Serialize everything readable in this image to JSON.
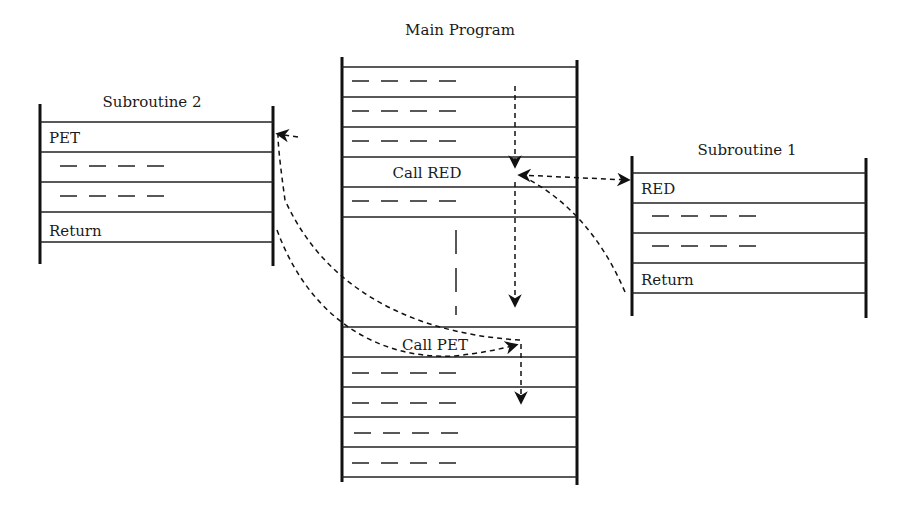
{
  "diagram": {
    "main_program": {
      "title": "Main Program",
      "rows": [
        {
          "type": "dashes"
        },
        {
          "type": "dashes"
        },
        {
          "type": "dashes"
        },
        {
          "type": "text",
          "label": "Call RED"
        },
        {
          "type": "dashes"
        },
        {
          "type": "gap"
        },
        {
          "type": "text",
          "label": "Call PET"
        },
        {
          "type": "dashes"
        },
        {
          "type": "dashes"
        },
        {
          "type": "dashes"
        },
        {
          "type": "dashes"
        }
      ]
    },
    "subroutine_2": {
      "title": "Subroutine 2",
      "rows": [
        {
          "type": "text",
          "label": "PET"
        },
        {
          "type": "dashes"
        },
        {
          "type": "dashes"
        },
        {
          "type": "text",
          "label": "Return"
        }
      ]
    },
    "subroutine_1": {
      "title": "Subroutine 1",
      "rows": [
        {
          "type": "text",
          "label": "RED"
        },
        {
          "type": "dashes"
        },
        {
          "type": "dashes"
        },
        {
          "type": "text",
          "label": "Return"
        }
      ]
    },
    "flows": [
      {
        "from": "Main Program",
        "to": "Call RED",
        "description": "sequential execution"
      },
      {
        "from": "Call RED",
        "to": "RED (Subroutine 1)",
        "description": "call"
      },
      {
        "from": "Return (Subroutine 1)",
        "to": "Call RED",
        "description": "return"
      },
      {
        "from": "Call RED",
        "to": "Call PET",
        "description": "sequential execution"
      },
      {
        "from": "Call PET",
        "to": "PET (Subroutine 2)",
        "description": "call"
      },
      {
        "from": "Return (Subroutine 2)",
        "to": "Call PET",
        "description": "return"
      },
      {
        "from": "Call PET",
        "to": "next instruction",
        "description": "sequential execution"
      }
    ]
  }
}
